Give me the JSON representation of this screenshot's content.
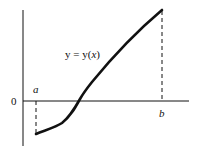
{
  "diagram": {
    "curve_label": "y = y(x)",
    "curve_label_parts": {
      "lhs": "y = y(",
      "var": "x",
      "close": ")"
    },
    "origin_label": "0",
    "left_bound_label": "a",
    "right_bound_label": "b",
    "colors": {
      "stroke": "#111111",
      "background": "#ffffff"
    }
  }
}
